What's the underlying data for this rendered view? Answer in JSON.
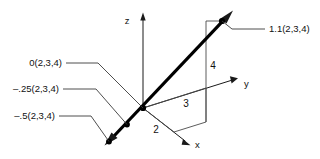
{
  "figure": {
    "background_color": "#ffffff",
    "line_color": "#000000",
    "axis_color": "#1a1a1a",
    "thin_line_color": "#4a4a4a"
  },
  "axes": [
    {
      "name": "z-axis",
      "label": "z"
    },
    {
      "name": "y-axis",
      "label": "y"
    },
    {
      "name": "x-axis",
      "label": "x"
    }
  ],
  "axis_labels": {
    "z": "z",
    "y": "y",
    "x": "x"
  },
  "component_labels": {
    "x_component": "2",
    "y_component": "3",
    "z_component": "4"
  },
  "callouts": [
    {
      "name": "callout-t-1-1",
      "text": "1.1(2,3,4)"
    },
    {
      "name": "callout-t-0",
      "text": "0(2,3,4)"
    },
    {
      "name": "callout-t-neg-25",
      "text": "–.25(2,3,4)"
    },
    {
      "name": "callout-t-neg-5",
      "text": "–.5(2,3,4)"
    }
  ],
  "points": [
    {
      "name": "point-t-1-1",
      "label": "1.1(2,3,4)",
      "coords": "(2,3,4)",
      "t": "1.1"
    },
    {
      "name": "point-origin",
      "label": "0(2,3,4)",
      "coords": "(2,3,4)",
      "t": "0"
    },
    {
      "name": "point-t-neg-25",
      "label": "–.25(2,3,4)",
      "coords": "(2,3,4)",
      "t": "-.25"
    },
    {
      "name": "point-t-neg-5",
      "label": "–.5(2,3,4)",
      "coords": "(2,3,4)",
      "t": "-.5"
    }
  ]
}
